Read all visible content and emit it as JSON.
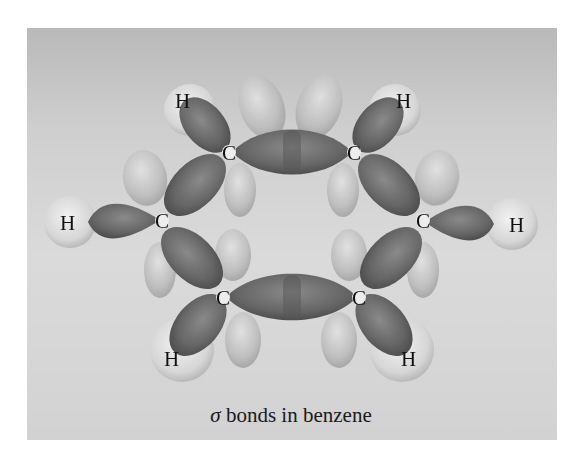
{
  "figure": {
    "caption_symbol": "σ",
    "caption_text": " bonds in benzene",
    "panel_color_top": "#b9b9b9",
    "panel_color_bottom": "#d6d6d6",
    "bond_orbital_color": "#6a6a6a",
    "lobe_color": "#bdbdbd",
    "hydrogen_color": "#d9d9d9"
  },
  "atoms": {
    "carbon_label": "C",
    "hydrogen_label": "H",
    "carbons": [
      {
        "id": "C1",
        "label": "C",
        "x": 229,
        "y": 152
      },
      {
        "id": "C2",
        "label": "C",
        "x": 354,
        "y": 152
      },
      {
        "id": "C3",
        "label": "C",
        "x": 162,
        "y": 220
      },
      {
        "id": "C4",
        "label": "C",
        "x": 423,
        "y": 220
      },
      {
        "id": "C5",
        "label": "C",
        "x": 223,
        "y": 297
      },
      {
        "id": "C6",
        "label": "C",
        "x": 359,
        "y": 297
      }
    ],
    "hydrogens": [
      {
        "id": "H1",
        "label": "H",
        "x": 182,
        "y": 100
      },
      {
        "id": "H2",
        "label": "H",
        "x": 403,
        "y": 100
      },
      {
        "id": "H3",
        "label": "H",
        "x": 68,
        "y": 222
      },
      {
        "id": "H4",
        "label": "H",
        "x": 517,
        "y": 224
      },
      {
        "id": "H5",
        "label": "H",
        "x": 172,
        "y": 358
      },
      {
        "id": "H6",
        "label": "H",
        "x": 409,
        "y": 358
      }
    ]
  }
}
